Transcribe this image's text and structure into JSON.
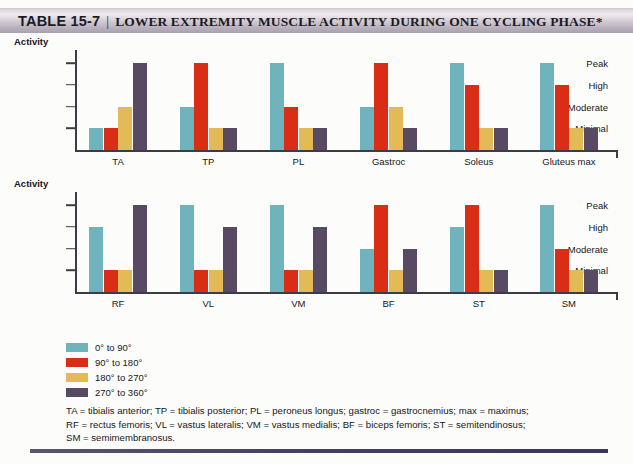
{
  "header": {
    "table_number": "TABLE 15-7",
    "separator": "|",
    "title": "LOWER EXTREMITY MUSCLE ACTIVITY DURING ONE CYCLING PHASE*"
  },
  "colors": {
    "series_0_90": "#6fb3bc",
    "series_90_180": "#d92d16",
    "series_180_270": "#e3ba55",
    "series_270_360": "#584a63",
    "axis": "#3c3c44",
    "text": "#17171c",
    "header_band_light": "#efebef",
    "header_band_dark": "#a9a1b0",
    "bottom_rule": "#474060"
  },
  "legend": {
    "position": "below-charts-left",
    "items": [
      {
        "label": "0° to 90°",
        "color": "#6fb3bc"
      },
      {
        "label": "90° to 180°",
        "color": "#d92d16"
      },
      {
        "label": "180° to 270°",
        "color": "#e3ba55"
      },
      {
        "label": "270° to 360°",
        "color": "#584a63"
      }
    ]
  },
  "footnote": {
    "lines": [
      "TA = tibialis anterior; TP = tibialis posterior; PL = peroneus longus; gastroc = gastrocnemius; max = maximus;",
      "RF = rectus femoris; VL = vastus lateralis; VM = vastus medialis; BF = biceps femoris; ST = semitendinosus;",
      "SM = semimembranosus."
    ]
  },
  "chart_data": [
    {
      "type": "bar",
      "id": "chart-lower-leg",
      "title": "Activity",
      "ylabel": "Activity",
      "xlabel": "",
      "grid": false,
      "legend_position": "below",
      "ytick_labels": [
        "Peak",
        "High",
        "Moderate",
        "Minimal"
      ],
      "yscale_levels": {
        "Minimal": 1,
        "Moderate": 2,
        "High": 3,
        "Peak": 4
      },
      "ylim": [
        0,
        4.6
      ],
      "categories": [
        "TA",
        "TP",
        "PL",
        "Gastroc",
        "Soleus",
        "Gluteus max"
      ],
      "series": [
        {
          "name": "0° to 90°",
          "color": "#6fb3bc",
          "levels": [
            "Minimal",
            "Moderate",
            "Peak",
            "Moderate",
            "Peak",
            "Peak"
          ],
          "values": [
            1,
            2,
            4,
            2,
            4,
            4
          ]
        },
        {
          "name": "90° to 180°",
          "color": "#d92d16",
          "levels": [
            "Minimal",
            "Peak",
            "Moderate",
            "Peak",
            "High",
            "High"
          ],
          "values": [
            1,
            4,
            2,
            4,
            3,
            3
          ]
        },
        {
          "name": "180° to 270°",
          "color": "#e3ba55",
          "levels": [
            "Moderate",
            "Minimal",
            "Minimal",
            "Moderate",
            "Minimal",
            "Minimal"
          ],
          "values": [
            2,
            1,
            1,
            2,
            1,
            1
          ]
        },
        {
          "name": "270° to 360°",
          "color": "#584a63",
          "levels": [
            "Peak",
            "Minimal",
            "Minimal",
            "Minimal",
            "Minimal",
            "Minimal"
          ],
          "values": [
            4,
            1,
            1,
            1,
            1,
            1
          ]
        }
      ]
    },
    {
      "type": "bar",
      "id": "chart-thigh",
      "title": "Activity",
      "ylabel": "Activity",
      "xlabel": "",
      "grid": false,
      "legend_position": "below",
      "ytick_labels": [
        "Peak",
        "High",
        "Moderate",
        "Minimal"
      ],
      "yscale_levels": {
        "Minimal": 1,
        "Moderate": 2,
        "High": 3,
        "Peak": 4
      },
      "ylim": [
        0,
        4.6
      ],
      "categories": [
        "RF",
        "VL",
        "VM",
        "BF",
        "ST",
        "SM"
      ],
      "series": [
        {
          "name": "0° to 90°",
          "color": "#6fb3bc",
          "levels": [
            "High",
            "Peak",
            "Peak",
            "Moderate",
            "High",
            "Peak"
          ],
          "values": [
            3,
            4,
            4,
            2,
            3,
            4
          ]
        },
        {
          "name": "90° to 180°",
          "color": "#d92d16",
          "levels": [
            "Minimal",
            "Minimal",
            "Minimal",
            "Peak",
            "Peak",
            "Moderate"
          ],
          "values": [
            1,
            1,
            1,
            4,
            4,
            2
          ]
        },
        {
          "name": "180° to 270°",
          "color": "#e3ba55",
          "levels": [
            "Minimal",
            "Minimal",
            "Minimal",
            "Minimal",
            "Minimal",
            "Minimal"
          ],
          "values": [
            1,
            1,
            1,
            1,
            1,
            1
          ]
        },
        {
          "name": "270° to 360°",
          "color": "#584a63",
          "levels": [
            "Peak",
            "High",
            "High",
            "Moderate",
            "Minimal",
            "Minimal"
          ],
          "values": [
            4,
            3,
            3,
            2,
            1,
            1
          ]
        }
      ]
    }
  ]
}
